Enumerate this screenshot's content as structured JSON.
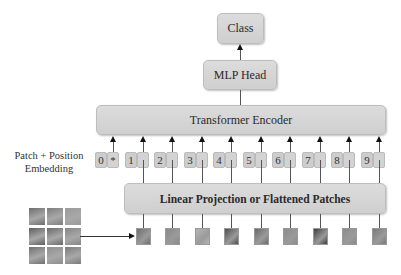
{
  "output": {
    "label": "Class"
  },
  "head": {
    "label": "MLP Head"
  },
  "encoder": {
    "label": "Transformer Encoder"
  },
  "embedding": {
    "label_line1": "Patch + Position",
    "label_line2": "Embedding",
    "tokens": [
      {
        "position": "0",
        "content": "*"
      },
      {
        "position": "1",
        "content": ""
      },
      {
        "position": "2",
        "content": ""
      },
      {
        "position": "3",
        "content": ""
      },
      {
        "position": "4",
        "content": ""
      },
      {
        "position": "5",
        "content": ""
      },
      {
        "position": "6",
        "content": ""
      },
      {
        "position": "7",
        "content": ""
      },
      {
        "position": "8",
        "content": ""
      },
      {
        "position": "9",
        "content": ""
      }
    ]
  },
  "projection": {
    "label": "Linear Projection or Flattened Patches"
  },
  "input_image": {
    "grid": "3x3",
    "patch_count": 9
  },
  "colors": {
    "box_fill": "#d4d4d4",
    "box_border": "#bdbdbd",
    "arrow": "#111111",
    "patch_shades": [
      "#6e6e6e",
      "#8a8a8a",
      "#b5b5b5",
      "#4f4f4f",
      "#6a6a6a",
      "#8d8d8d",
      "#3f3f3f",
      "#8c8c8c",
      "#7a7a7a"
    ]
  }
}
